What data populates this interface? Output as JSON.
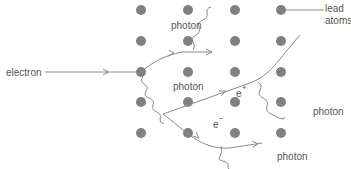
{
  "diagram": {
    "labels": {
      "electron": "electron",
      "lead_atoms_line1": "lead",
      "lead_atoms_line2": "atoms",
      "photon_top": "photon",
      "photon_middle": "photon",
      "photon_right": "photon",
      "photon_bottom": "photon",
      "e_upper": "e",
      "e_upper_sup": "+",
      "e_lower": "e",
      "e_lower_sup": "−"
    },
    "lattice": {
      "columns_x": [
        141,
        188,
        235,
        281
      ],
      "rows_y": [
        10,
        41,
        72,
        102,
        133
      ],
      "atom_color": "#808080",
      "atom_radius": 5
    },
    "colors": {
      "line": "#8a8a8a",
      "text": "#555555"
    }
  }
}
